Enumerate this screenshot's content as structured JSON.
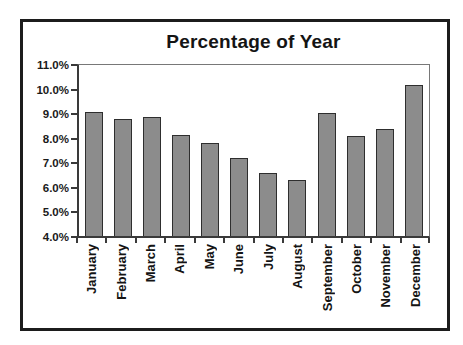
{
  "chart_data": {
    "type": "bar",
    "title": "Percentage of Year",
    "categories": [
      "January",
      "February",
      "March",
      "April",
      "May",
      "June",
      "July",
      "August",
      "September",
      "October",
      "November",
      "December"
    ],
    "values": [
      9.1,
      8.8,
      8.9,
      8.15,
      7.8,
      7.2,
      6.6,
      6.3,
      9.05,
      8.1,
      8.4,
      10.2
    ],
    "value_unit": "%",
    "xlabel": "",
    "ylabel": "",
    "ylim": [
      4.0,
      11.0
    ],
    "y_tick_step": 1.0,
    "y_tick_labels": [
      "11.0%",
      "10.0%",
      "9.0%",
      "8.0%",
      "7.0%",
      "6.0%",
      "5.0%",
      "4.0%"
    ],
    "grid": false,
    "legend": "none",
    "colors": {
      "bar_fill": "#8c8c8c",
      "bar_border": "#2e2e2e",
      "frame_border": "#1c1c1c",
      "axis": "#3a3a3a",
      "plot_border": "#787878",
      "text": "#141414",
      "background": "#ffffff"
    }
  }
}
